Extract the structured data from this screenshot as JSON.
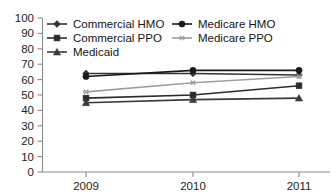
{
  "chart_data": {
    "type": "line",
    "title": "",
    "subtitle": "",
    "xlabel": "",
    "ylabel": "",
    "categories": [
      "2009",
      "2010",
      "2011"
    ],
    "x": [
      2009,
      2010,
      2011
    ],
    "ylim": [
      0,
      100
    ],
    "yticks": [
      0,
      10,
      20,
      30,
      40,
      50,
      60,
      70,
      80,
      90,
      100
    ],
    "ytick_labels": [
      "0",
      "10",
      "20",
      "30",
      "40",
      "50",
      "60",
      "70",
      "80",
      "90",
      "100"
    ],
    "grid": false,
    "legend_position": "top-left-inside",
    "series": [
      {
        "name": "Commercial HMO",
        "marker": "diamond",
        "color": "#333333",
        "values": [
          64,
          64,
          63
        ]
      },
      {
        "name": "Medicare HMO",
        "marker": "circle",
        "color": "#1a1a1a",
        "values": [
          62,
          66,
          66
        ]
      },
      {
        "name": "Commercial PPO",
        "marker": "square",
        "color": "#2b2b2b",
        "values": [
          48,
          50,
          56
        ]
      },
      {
        "name": "Medicare PPO",
        "marker": "star",
        "color": "#9e9e9e",
        "values": [
          52,
          58,
          62
        ]
      },
      {
        "name": "Medicaid",
        "marker": "triangle",
        "color": "#3a3a3a",
        "values": [
          45,
          47,
          48
        ]
      }
    ]
  },
  "axes": {
    "y_axis_name": "y-axis",
    "x_axis_name": "x-axis"
  },
  "legend": {
    "entries": [
      {
        "label": "Commercial HMO",
        "marker": "diamond",
        "color": "#333333"
      },
      {
        "label": "Medicare HMO",
        "marker": "circle",
        "color": "#1a1a1a"
      },
      {
        "label": "Commercial PPO",
        "marker": "square",
        "color": "#2b2b2b"
      },
      {
        "label": "Medicare PPO",
        "marker": "star",
        "color": "#9e9e9e"
      },
      {
        "label": "Medicaid",
        "marker": "triangle",
        "color": "#3a3a3a"
      }
    ]
  }
}
